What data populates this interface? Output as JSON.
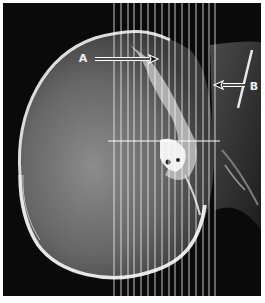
{
  "figure": {
    "width": 265,
    "height": 303,
    "frame": {
      "x": 3,
      "y": 3,
      "width": 258,
      "height": 293,
      "background": "#0a0a0a",
      "border": "#ffffff"
    },
    "colors": {
      "background": "#0a0a0a",
      "bone": "#e6e6e6",
      "brain_inner": "#7a7a7a",
      "soft_tissue": "#3a3a3a",
      "grid_line": "#ffffff"
    },
    "annotations": [
      {
        "label": "A",
        "label_x": 83,
        "label_y": 62,
        "arrow": {
          "from_x": 95,
          "to_x": 158,
          "y": 59,
          "direction": "right"
        }
      },
      {
        "label": "B",
        "label_x": 254,
        "label_y": 90,
        "arrow": {
          "from_x": 245,
          "to_x": 214,
          "y": 85,
          "direction": "left"
        }
      }
    ],
    "grid": {
      "vertical_lines_x": [
        114,
        121,
        128,
        134,
        141,
        148,
        155,
        162,
        169,
        175,
        182,
        189,
        196,
        203,
        209,
        215
      ],
      "vertical_y_start": 3,
      "vertical_y_end": 296,
      "horizontal_line": {
        "y": 141,
        "x_start": 108,
        "x_end": 220
      }
    }
  }
}
